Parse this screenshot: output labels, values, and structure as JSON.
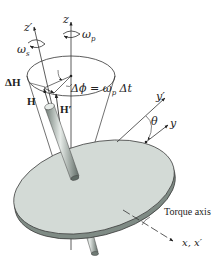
{
  "figure": {
    "colors": {
      "disk_top": "#d3dad6",
      "disk_edge": "#8e9a94",
      "rod": "#8a968f",
      "rod_highlight": "#e6ebe8",
      "line": "#333333"
    },
    "labels": {
      "z_prime": "z′",
      "z": "z",
      "omega_s": "ω",
      "omega_s_sub": "s",
      "omega_p": "ω",
      "omega_p_sub": "p",
      "delta_H": "ΔH",
      "H": "H",
      "H_prime": "H′",
      "delta_phi_eq": "Δϕ = ω",
      "delta_phi_sub": "p",
      "delta_t": " Δt",
      "y_prime": "y′",
      "y": "y",
      "theta": "θ",
      "torque_axis": "Torque axis",
      "x_axes": "x, x′"
    }
  }
}
